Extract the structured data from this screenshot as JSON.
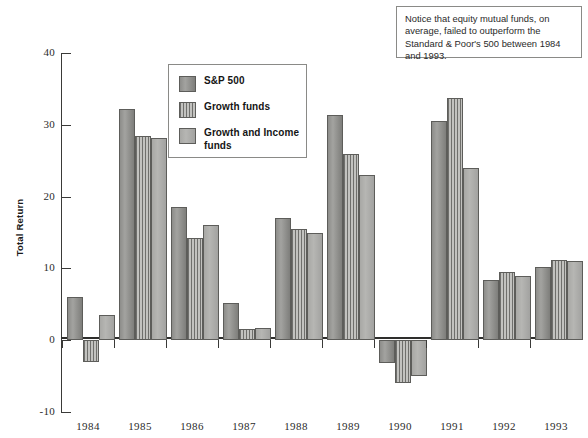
{
  "chart_data": {
    "type": "bar",
    "title": "",
    "xlabel": "",
    "ylabel": "Total Return",
    "ylim": [
      -10,
      40
    ],
    "yticks": [
      -10,
      0,
      10,
      20,
      30,
      40
    ],
    "ytick_labels": [
      "-10",
      "0",
      "10",
      "20",
      "30",
      "40"
    ],
    "grid": false,
    "legend_position": "upper-left-inside",
    "categories": [
      "1984",
      "1985",
      "1986",
      "1987",
      "1988",
      "1989",
      "1990",
      "1991",
      "1992",
      "1993"
    ],
    "series": [
      {
        "name": "S&P 500",
        "pattern": "solid-dark-gray",
        "color": "#8f8f8c",
        "values": [
          6.0,
          32.2,
          18.5,
          5.2,
          17.0,
          31.3,
          -3.2,
          30.5,
          8.4,
          10.2
        ]
      },
      {
        "name": "Growth funds",
        "pattern": "vertical-stripes",
        "color": "#6f6f6c",
        "values": [
          -3.0,
          28.5,
          14.3,
          1.5,
          15.5,
          26.0,
          -6.0,
          33.8,
          9.5,
          11.2
        ]
      },
      {
        "name": "Growth and Income funds",
        "pattern": "solid-light-gray",
        "color": "#b0b0ad",
        "values": [
          3.5,
          28.1,
          16.0,
          1.7,
          15.0,
          23.0,
          -5.0,
          24.0,
          9.0,
          11.0
        ]
      }
    ],
    "annotations": [
      {
        "id": "note-box",
        "text": "Notice that equity mutual funds, on average, failed to outperform the Standard & Poor's 500 between 1984 and 1993."
      }
    ]
  },
  "axis": {
    "y_title": "Total Return"
  },
  "legend": {
    "items": [
      {
        "label": "S&P 500"
      },
      {
        "label": "Growth funds"
      },
      {
        "label": "Growth and Income funds"
      }
    ]
  },
  "note": {
    "text": "Notice that equity mutual funds, on average, failed to outperform the Standard & Poor's 500 between 1984 and 1993."
  }
}
